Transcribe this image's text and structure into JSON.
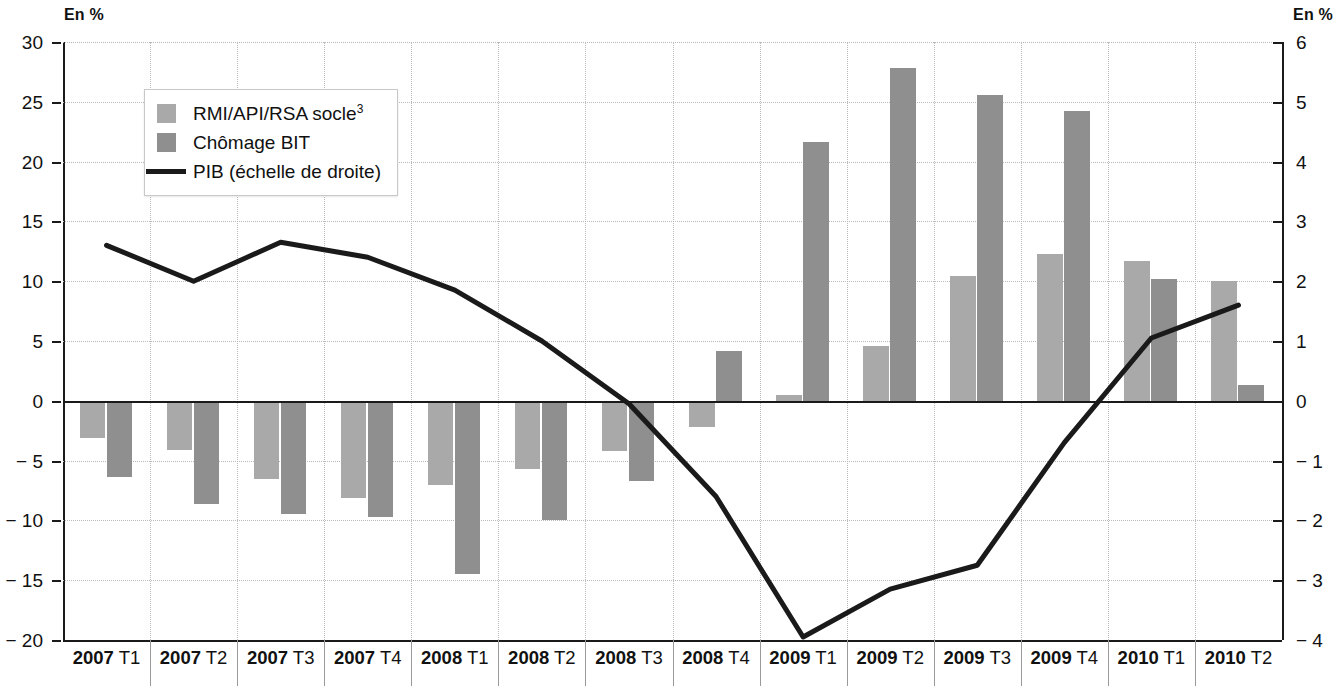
{
  "axes": {
    "left_unit_label": "En %",
    "right_unit_label": "En %",
    "left_ticks": [
      "30",
      "25",
      "20",
      "15",
      "10",
      "5",
      "0",
      "− 5",
      "− 10",
      "− 15",
      "− 20"
    ],
    "right_ticks": [
      "6",
      "5",
      "4",
      "3",
      "2",
      "1",
      "0",
      "− 1",
      "− 2",
      "− 3",
      "− 4"
    ]
  },
  "legend": {
    "items": [
      {
        "label": "RMI/API/RSA socle",
        "sup": "3",
        "type": "swatch",
        "color": "#a9a9a9",
        "name": "legend-rmi"
      },
      {
        "label": "Chômage BIT",
        "sup": "",
        "type": "swatch",
        "color": "#8f8f8f",
        "name": "legend-chomage"
      },
      {
        "label": "PIB (échelle de droite)",
        "sup": "",
        "type": "line",
        "color": "#1a1a1a",
        "name": "legend-pib"
      }
    ]
  },
  "chart_data": {
    "type": "bar",
    "title": "",
    "xlabel": "",
    "ylabel": "En %",
    "categories": [
      "2007 T1",
      "2007 T2",
      "2007 T3",
      "2007 T4",
      "2008 T1",
      "2008 T2",
      "2008 T3",
      "2008 T4",
      "2009 T1",
      "2009 T2",
      "2009 T3",
      "2009 T4",
      "2010 T1",
      "2010 T2"
    ],
    "category_parts": [
      {
        "year": "2007",
        "quarter": "T1"
      },
      {
        "year": "2007",
        "quarter": "T2"
      },
      {
        "year": "2007",
        "quarter": "T3"
      },
      {
        "year": "2007",
        "quarter": "T4"
      },
      {
        "year": "2008",
        "quarter": "T1"
      },
      {
        "year": "2008",
        "quarter": "T2"
      },
      {
        "year": "2008",
        "quarter": "T3"
      },
      {
        "year": "2008",
        "quarter": "T4"
      },
      {
        "year": "2009",
        "quarter": "T1"
      },
      {
        "year": "2009",
        "quarter": "T2"
      },
      {
        "year": "2009",
        "quarter": "T3"
      },
      {
        "year": "2009",
        "quarter": "T4"
      },
      {
        "year": "2010",
        "quarter": "T1"
      },
      {
        "year": "2010",
        "quarter": "T2"
      }
    ],
    "ylim": [
      -20,
      30
    ],
    "ylim_right": [
      -4,
      6
    ],
    "ytick_step": 5,
    "ytick_step_right": 1,
    "grid": true,
    "legend_position": "upper-left-inside",
    "series": [
      {
        "name": "RMI/API/RSA socle",
        "type": "bar",
        "axis": "left",
        "color": "#a9a9a9",
        "values": [
          -3.1,
          -4.1,
          -6.5,
          -8.1,
          -7.0,
          -5.7,
          -4.2,
          -2.2,
          0.5,
          4.6,
          10.4,
          12.3,
          11.7,
          10.0
        ]
      },
      {
        "name": "Chômage BIT",
        "type": "bar",
        "axis": "left",
        "color": "#8f8f8f",
        "values": [
          -6.4,
          -8.6,
          -9.5,
          -9.7,
          -14.5,
          -10.0,
          -6.7,
          4.2,
          21.6,
          27.8,
          25.6,
          24.2,
          10.2,
          1.3
        ]
      },
      {
        "name": "PIB (échelle de droite)",
        "type": "line",
        "axis": "right",
        "color": "#1a1a1a",
        "values": [
          2.6,
          2.0,
          2.65,
          2.4,
          1.85,
          1.0,
          -0.05,
          -1.6,
          -3.95,
          -3.15,
          -2.75,
          -0.7,
          1.05,
          1.6
        ]
      }
    ]
  }
}
